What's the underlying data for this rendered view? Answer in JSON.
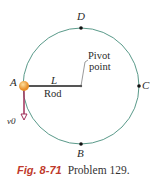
{
  "diagram": {
    "points": {
      "A": "A",
      "B": "B",
      "C": "C",
      "D": "D"
    },
    "rod_length_label": "L",
    "rod_label": "Rod",
    "pivot_label_line1": "Pivot",
    "pivot_label_line2": "point",
    "velocity_label": "v0",
    "colors": {
      "circle": "#5a9a8a",
      "rod": "#555555",
      "ball": "#f0a030",
      "arrow": "#a0305a"
    }
  },
  "caption": {
    "figure": "Fig. 8-71",
    "text": "Problem 129."
  }
}
